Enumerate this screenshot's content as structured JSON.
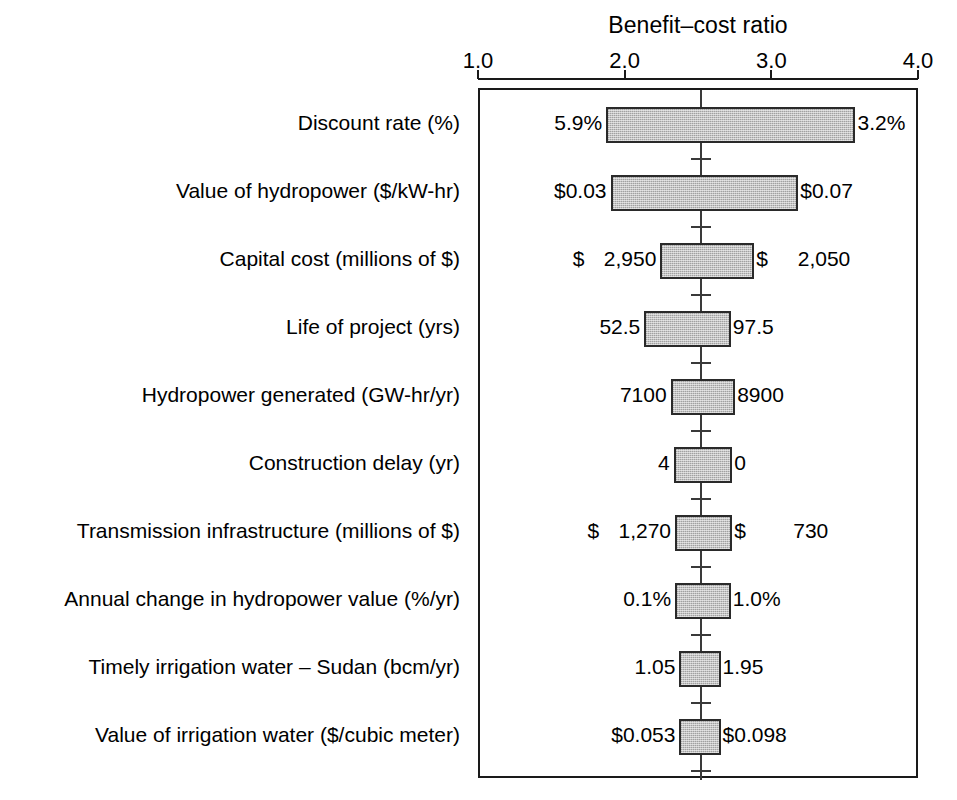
{
  "chart_data": {
    "type": "bar",
    "subtype": "tornado",
    "title": "Benefit–cost ratio",
    "xlabel": "Benefit–cost ratio",
    "ylabel": "",
    "xlim": [
      1.0,
      4.0
    ],
    "xticks": [
      1.0,
      2.0,
      3.0,
      4.0
    ],
    "xtick_labels": [
      "1.0",
      "2.0",
      "3.0",
      "4.0"
    ],
    "base_value": 2.51,
    "grid": false,
    "legend": "none",
    "categories": [
      "Discount rate (%)",
      "Value of hydropower ($/kW-hr)",
      "Capital cost (millions of $)",
      "Life of project (yrs)",
      "Hydropower generated (GW-hr/yr)",
      "Construction delay (yr)",
      "Transmission infrastructure (millions of $)",
      "Annual change in hydropower value (%/yr)",
      "Timely irrigation water – Sudan (bcm/yr)",
      "Value of irrigation water ($/cubic meter)"
    ],
    "bars": [
      {
        "category": "Discount rate (%)",
        "low_ratio": 1.86,
        "high_ratio": 3.56,
        "low_label": "5.9%",
        "high_label": "3.2%",
        "low_is_money": false,
        "high_is_money": false
      },
      {
        "category": "Value of hydropower ($/kW-hr)",
        "low_ratio": 1.89,
        "high_ratio": 3.17,
        "low_label": "$0.03",
        "high_label": "$0.07",
        "low_is_money": false,
        "high_is_money": false
      },
      {
        "category": "Capital cost (millions of $)",
        "low_ratio": 2.23,
        "high_ratio": 2.87,
        "low_label": "$  2,950",
        "high_label": "$  2,050",
        "low_sym": "$",
        "low_num": "2,950",
        "high_sym": "$",
        "high_num": "2,050",
        "low_is_money": true,
        "high_is_money": true
      },
      {
        "category": "Life of project (yrs)",
        "low_ratio": 2.12,
        "high_ratio": 2.71,
        "low_label": "52.5",
        "high_label": "97.5",
        "low_is_money": false,
        "high_is_money": false
      },
      {
        "category": "Hydropower generated (GW-hr/yr)",
        "low_ratio": 2.3,
        "high_ratio": 2.74,
        "low_label": "7100",
        "high_label": "8900",
        "low_is_money": false,
        "high_is_money": false
      },
      {
        "category": "Construction delay (yr)",
        "low_ratio": 2.32,
        "high_ratio": 2.72,
        "low_label": "4",
        "high_label": "0",
        "low_is_money": false,
        "high_is_money": false
      },
      {
        "category": "Transmission infrastructure (millions of $)",
        "low_ratio": 2.33,
        "high_ratio": 2.72,
        "low_label": "$  1,270",
        "high_label": "$    730",
        "low_sym": "$",
        "low_num": "1,270",
        "high_sym": "$",
        "high_num": "730",
        "low_is_money": true,
        "high_is_money": true
      },
      {
        "category": "Annual change in hydropower value (%/yr)",
        "low_ratio": 2.33,
        "high_ratio": 2.71,
        "low_label": "0.1%",
        "high_label": "1.0%",
        "low_is_money": false,
        "high_is_money": false
      },
      {
        "category": "Timely irrigation water – Sudan (bcm/yr)",
        "low_ratio": 2.36,
        "high_ratio": 2.64,
        "low_label": "1.05",
        "high_label": "1.95",
        "low_is_money": false,
        "high_is_money": false
      },
      {
        "category": "Value of irrigation water ($/cubic meter)",
        "low_ratio": 2.36,
        "high_ratio": 2.64,
        "low_label": "$0.053",
        "high_label": "$0.098",
        "low_is_money": false,
        "high_is_money": false
      }
    ],
    "colors": {
      "bar_fill": "#c3c3c3",
      "bar_border": "#2a2a2a",
      "axis": "#1a1a1a",
      "center_line": "#3a3a3a",
      "text": "#000000",
      "background": "#ffffff"
    }
  }
}
